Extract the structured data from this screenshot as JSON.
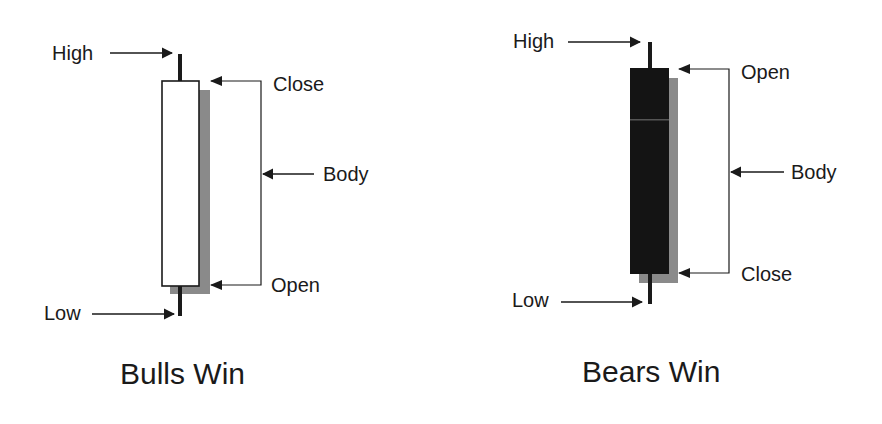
{
  "diagram": {
    "colors": {
      "bull_body": "#ffffff",
      "bear_body": "#141414",
      "shadow": "#8a8a8a",
      "line": "#1a1a1a"
    },
    "bull": {
      "caption": "Bulls Win",
      "labels": {
        "high": "High",
        "low": "Low",
        "top": "Close",
        "bottom": "Open",
        "body": "Body"
      }
    },
    "bear": {
      "caption": "Bears Win",
      "labels": {
        "high": "High",
        "low": "Low",
        "top": "Open",
        "bottom": "Close",
        "body": "Body"
      }
    }
  }
}
